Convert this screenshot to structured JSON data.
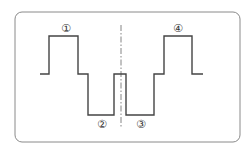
{
  "diagram": {
    "type": "waveform",
    "frame": {
      "x": 15,
      "y": 12,
      "width": 225,
      "height": 130,
      "radius": 7,
      "stroke": "#8a8a8a"
    },
    "waveform": {
      "stroke": "#444444",
      "levels": {
        "high": 36,
        "mid": 74,
        "low": 115
      },
      "points": "40,74 49,74 49,36 78,36 78,74 88,74 88,115 114,115 114,74 126,74 126,115 154,115 154,74 164,74 164,36 192,36 192,74 203,74"
    },
    "center_line": {
      "x": 121,
      "y1": 25,
      "y2": 128,
      "stroke": "#666666"
    },
    "labels": [
      {
        "text": "①",
        "x": 66,
        "y": 32
      },
      {
        "text": "②",
        "x": 102,
        "y": 128
      },
      {
        "text": "③",
        "x": 141,
        "y": 128
      },
      {
        "text": "④",
        "x": 178,
        "y": 32
      }
    ]
  }
}
